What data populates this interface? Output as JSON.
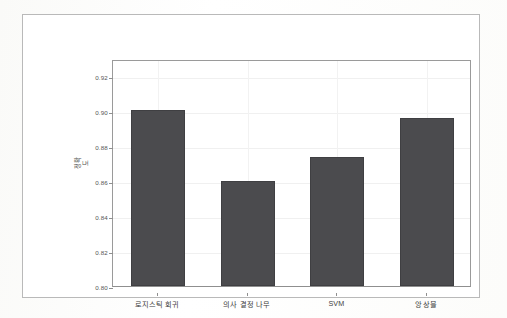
{
  "chart_data": {
    "type": "bar",
    "title": "",
    "subtitle": "",
    "xlabel": "",
    "ylabel": "정확도",
    "categories": [
      "로지스틱 회귀",
      "의사 결정 나무",
      "SVM",
      "앙상블"
    ],
    "values": [
      0.901,
      0.86,
      0.874,
      0.896
    ],
    "series": [
      {
        "name": "정확도",
        "values": [
          0.901,
          0.86,
          0.874,
          0.896
        ]
      }
    ],
    "ylim": [
      0.8,
      0.93
    ],
    "xlim": [
      0,
      4
    ],
    "yticks": [
      "0.92",
      "0.90",
      "0.88",
      "0.86",
      "0.84",
      "0.82",
      "0.80"
    ],
    "ytick_values": [
      0.92,
      0.9,
      0.88,
      0.86,
      0.84,
      0.82,
      0.8
    ],
    "grid": true,
    "grid_axis": "both",
    "legend": false,
    "legend_position": "none",
    "bar_color": "#4b4b4e",
    "grid_color": "#f0f0f0",
    "axis_color": "#9a9a9a",
    "background_color": "#ffffff",
    "frame_color": "#b9b9b9",
    "bar_width_ratio": 0.6,
    "annotations": []
  }
}
